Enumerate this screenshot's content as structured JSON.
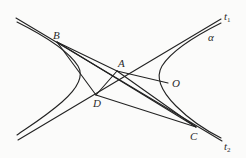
{
  "figure": {
    "type": "hyperbola-quadrilateral-diagram",
    "colors": {
      "stroke": "#222222",
      "background": "#fbfbfa",
      "label": "#2a2a2a"
    },
    "points": {
      "A": {
        "label": "A",
        "x": 117,
        "y": 71
      },
      "B": {
        "label": "B",
        "x": 57,
        "y": 42
      },
      "C": {
        "label": "C",
        "x": 196,
        "y": 127
      },
      "D": {
        "label": "D",
        "x": 96,
        "y": 95
      },
      "O": {
        "label": "O",
        "x": 172,
        "y": 82
      }
    },
    "asymptotes": {
      "t1": {
        "label": "t",
        "subscript": "1"
      },
      "t2": {
        "label": "t",
        "subscript": "2"
      }
    },
    "curve_label": "α"
  }
}
